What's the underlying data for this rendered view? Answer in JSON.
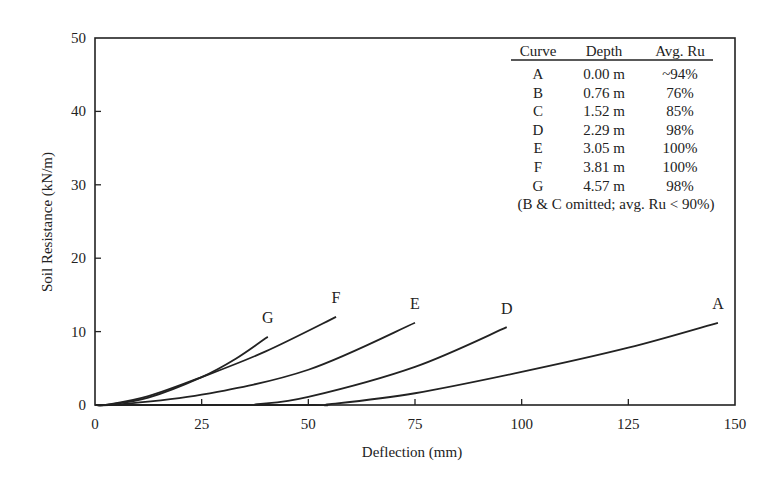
{
  "chart_data": {
    "type": "line",
    "title": "",
    "xlabel": "Deflection (mm)",
    "ylabel": "Soil Resistance (kN/m)",
    "xlim": [
      0,
      150
    ],
    "ylim": [
      0,
      50
    ],
    "xticks": [
      0,
      25,
      50,
      75,
      100,
      125,
      150
    ],
    "yticks": [
      0,
      10,
      20,
      30,
      40,
      50
    ],
    "grid": false,
    "legend_position": "upper right (table)",
    "series": [
      {
        "name": "A",
        "label_pos": [
          146,
          13.7
        ],
        "x": [
          0,
          50,
          55,
          75,
          100,
          125,
          146
        ],
        "y": [
          0,
          0,
          0.1,
          1.6,
          4.5,
          7.8,
          11.2
        ]
      },
      {
        "name": "D",
        "label_pos": [
          96.5,
          13.1
        ],
        "x": [
          0,
          35,
          38,
          50,
          75,
          96.5
        ],
        "y": [
          0,
          0,
          0.1,
          1.1,
          5.2,
          10.6
        ]
      },
      {
        "name": "E",
        "label_pos": [
          75,
          13.7
        ],
        "x": [
          0,
          5,
          25,
          50,
          75
        ],
        "y": [
          0,
          0.05,
          1.4,
          4.8,
          11.2
        ]
      },
      {
        "name": "F",
        "label_pos": [
          56.5,
          14.6
        ],
        "x": [
          0,
          3,
          12.5,
          25,
          40,
          56.5
        ],
        "y": [
          0,
          0.05,
          1.2,
          3.8,
          7.3,
          12.0
        ]
      },
      {
        "name": "G",
        "label_pos": [
          40.5,
          11.8
        ],
        "x": [
          0,
          3,
          12.5,
          25,
          33,
          40.5
        ],
        "y": [
          0,
          0.05,
          1.0,
          3.8,
          6.3,
          9.3
        ]
      }
    ],
    "table": {
      "headers": [
        "Curve",
        "Depth",
        "Avg. Ru"
      ],
      "rows": [
        [
          "A",
          "0.00 m",
          "~94%"
        ],
        [
          "B",
          "0.76 m",
          "76%"
        ],
        [
          "C",
          "1.52 m",
          "85%"
        ],
        [
          "D",
          "2.29 m",
          "98%"
        ],
        [
          "E",
          "3.05 m",
          "100%"
        ],
        [
          "F",
          "3.81 m",
          "100%"
        ],
        [
          "G",
          "4.57 m",
          "98%"
        ]
      ],
      "note": "(B & C omitted; avg. Ru < 90%)"
    }
  }
}
